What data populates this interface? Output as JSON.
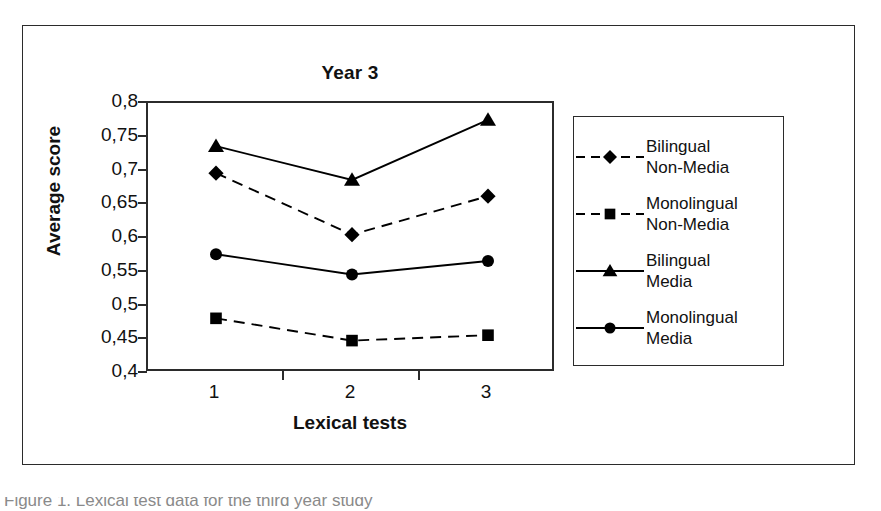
{
  "figure": {
    "title": "Year 3",
    "caption_clipped": "Figure 1. Lexical test data for the third year study"
  },
  "axes": {
    "y_title": "Average score",
    "x_title": "Lexical tests",
    "y_tick_labels": [
      "0,8",
      "0,75",
      "0,7",
      "0,65",
      "0,6",
      "0,55",
      "0,5",
      "0,45",
      "0,4"
    ],
    "x_tick_labels": [
      "1",
      "2",
      "3"
    ]
  },
  "legend": {
    "entries": [
      {
        "label": "Bilingual\nNon-Media",
        "marker": "diamond",
        "line": "dashed"
      },
      {
        "label": "Monolingual\nNon-Media",
        "marker": "square",
        "line": "dashed"
      },
      {
        "label": "Bilingual\nMedia",
        "marker": "triangle",
        "line": "solid"
      },
      {
        "label": "Monolingual\nMedia",
        "marker": "circle",
        "line": "solid"
      }
    ]
  },
  "colors": {
    "ink": "#000000",
    "frame": "#2b2b2b",
    "background": "#ffffff"
  },
  "chart_data": {
    "type": "line",
    "title": "Year 3",
    "xlabel": "Lexical tests",
    "ylabel": "Average score",
    "categories": [
      "1",
      "2",
      "3"
    ],
    "ylim": [
      0.4,
      0.8
    ],
    "yticks": [
      0.4,
      0.45,
      0.5,
      0.55,
      0.6,
      0.65,
      0.7,
      0.75,
      0.8
    ],
    "ytick_labels": [
      "0,4",
      "0,45",
      "0,5",
      "0,55",
      "0,6",
      "0,65",
      "0,7",
      "0,75",
      "0,8"
    ],
    "grid": false,
    "legend_position": "right-outside",
    "decimal_separator": ",",
    "series": [
      {
        "name": "Bilingual Media",
        "marker": "triangle",
        "line": "solid",
        "values": [
          0.736,
          0.686,
          0.775
        ]
      },
      {
        "name": "Bilingual Non-Media",
        "marker": "diamond",
        "line": "dashed",
        "values": [
          0.696,
          0.605,
          0.662
        ]
      },
      {
        "name": "Monolingual Media",
        "marker": "circle",
        "line": "solid",
        "values": [
          0.576,
          0.546,
          0.566
        ]
      },
      {
        "name": "Monolingual Non-Media",
        "marker": "square",
        "line": "dashed",
        "values": [
          0.481,
          0.448,
          0.456
        ]
      }
    ]
  }
}
